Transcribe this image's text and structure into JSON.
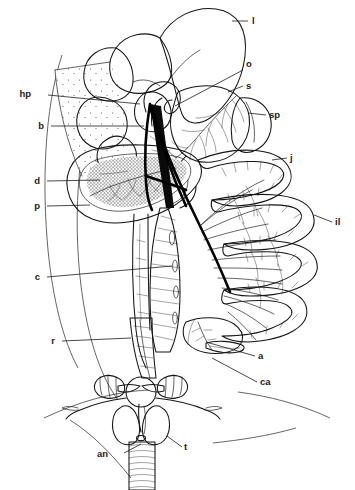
{
  "figure": {
    "kind": "anatomical-line-drawing",
    "background_color": "#ffffff",
    "ink_color": "#151515",
    "width": 355,
    "height": 490
  },
  "labels": [
    {
      "id": "l",
      "text": "l",
      "x": 252,
      "y": 24,
      "side": "right",
      "leader": "M 248 21 L 232 21"
    },
    {
      "id": "o",
      "text": "o",
      "x": 246,
      "y": 67,
      "side": "right",
      "leader": "M 243 70 L 175 106"
    },
    {
      "id": "s",
      "text": "s",
      "x": 246,
      "y": 89,
      "side": "right",
      "leader": "M 243 86 L 228 92"
    },
    {
      "id": "sp",
      "text": "sp",
      "x": 269,
      "y": 118,
      "side": "right",
      "leader": "M 266 115 L 248 113"
    },
    {
      "id": "j",
      "text": "j",
      "x": 290,
      "y": 161,
      "side": "right",
      "leader": "M 287 158 L 272 160"
    },
    {
      "id": "il",
      "text": "il",
      "x": 335,
      "y": 225,
      "side": "right",
      "leader": "M 332 222 L 314 215"
    },
    {
      "id": "a",
      "text": "a",
      "x": 258,
      "y": 359,
      "side": "right",
      "leader": "M 255 356 L 206 342"
    },
    {
      "id": "ca",
      "text": "ca",
      "x": 260,
      "y": 385,
      "side": "right",
      "leader": "M 257 382 L 212 358"
    },
    {
      "id": "hp",
      "text": "hp",
      "x": 31,
      "y": 97,
      "side": "left",
      "leader": "M 48 95 L 140 104"
    },
    {
      "id": "b",
      "text": "b",
      "x": 44,
      "y": 129,
      "side": "left",
      "leader": "M 51 126 L 144 126"
    },
    {
      "id": "d",
      "text": "d",
      "x": 40,
      "y": 184,
      "side": "left",
      "leader": "M 47 181 L 100 180"
    },
    {
      "id": "p",
      "text": "p",
      "x": 40,
      "y": 209,
      "side": "left",
      "leader": "M 47 206 L 90 205"
    },
    {
      "id": "c",
      "text": "c",
      "x": 40,
      "y": 280,
      "side": "left",
      "leader": "M 47 277 L 172 266"
    },
    {
      "id": "r",
      "text": "r",
      "x": 55,
      "y": 344,
      "side": "left",
      "leader": "M 62 341 L 131 338"
    },
    {
      "id": "an",
      "text": "an",
      "x": 108,
      "y": 457,
      "side": "left",
      "leader": "M 124 453 L 141 444"
    },
    {
      "id": "t",
      "text": "t",
      "x": 184,
      "y": 450,
      "side": "right",
      "leader": "M 182 447 L 167 436"
    }
  ],
  "legend_terms": {
    "l": "liver",
    "o": "oesophagus",
    "s": "stomach",
    "sp": "spleen",
    "j": "jejunum",
    "il": "ileum",
    "a": "appendix",
    "ca": "caecum",
    "hp": "hepatic portal region",
    "b": "bile duct",
    "d": "duodenum",
    "p": "pancreas",
    "c": "colon",
    "r": "rectum",
    "an": "anus",
    "t": "testis"
  }
}
